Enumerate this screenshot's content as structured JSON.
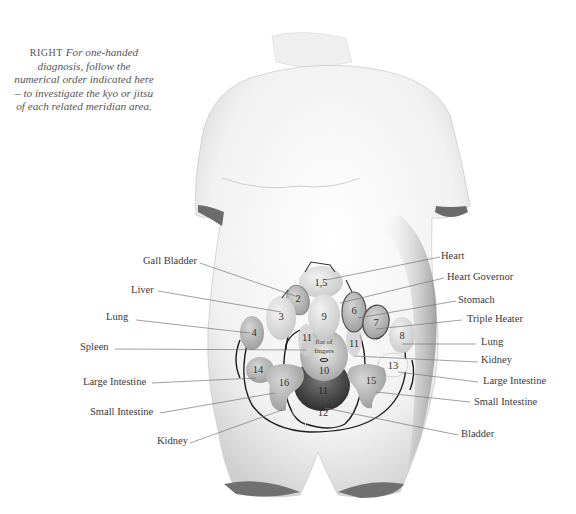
{
  "caption": {
    "lead": "RIGHT",
    "text": "For one-handed diagnosis, follow the numerical order indicated here – to investigate the kyo or jitsu of each related meridian area."
  },
  "labels_left": [
    {
      "id": "gall-bladder",
      "text": "Gall Bladder"
    },
    {
      "id": "liver",
      "text": "Liver"
    },
    {
      "id": "lung-left",
      "text": "Lung"
    },
    {
      "id": "spleen",
      "text": "Spleen"
    },
    {
      "id": "large-intestine-left",
      "text": "Large Intestine"
    },
    {
      "id": "small-intestine-left",
      "text": "Small Intestine"
    },
    {
      "id": "kidney-left",
      "text": "Kidney"
    }
  ],
  "labels_right": [
    {
      "id": "heart",
      "text": "Heart"
    },
    {
      "id": "heart-governor",
      "text": "Heart Governor"
    },
    {
      "id": "stomach",
      "text": "Stomach"
    },
    {
      "id": "triple-heater",
      "text": "Triple Heater"
    },
    {
      "id": "lung-right",
      "text": "Lung"
    },
    {
      "id": "kidney-right",
      "text": "Kidney"
    },
    {
      "id": "large-intestine-right",
      "text": "Large Intestine"
    },
    {
      "id": "small-intestine-right",
      "text": "Small Intestine"
    },
    {
      "id": "bladder",
      "text": "Bladder"
    }
  ],
  "zones": {
    "z15": "1,5",
    "z2": "2",
    "z3": "3",
    "z4": "4",
    "z6": "6",
    "z7": "7",
    "z8": "8",
    "z9": "9",
    "z10": "10",
    "z11a": "11",
    "z11b": "11",
    "z11c": "11",
    "z12": "12",
    "z13": "13",
    "z14": "14",
    "z15b": "15",
    "z16": "16"
  },
  "center_note_line1": "flat of",
  "center_note_line2": "fingers"
}
